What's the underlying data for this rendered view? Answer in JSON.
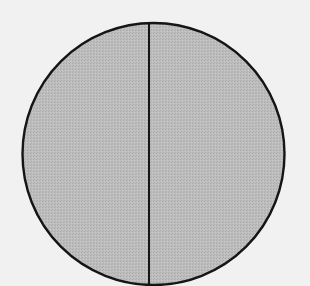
{
  "diagram": {
    "shape": "circle",
    "divided_into": 2,
    "division": "vertical line",
    "colors": {
      "background": "#f1f1f1",
      "fill": "#bdbdbd",
      "fill_dot": "#a9a9a9",
      "stroke": "#151515"
    },
    "geometry": {
      "cx": 153.5,
      "cy": 154,
      "r": 131,
      "divider_x": 149,
      "stroke_width": 2.4,
      "divider_width": 2
    }
  }
}
